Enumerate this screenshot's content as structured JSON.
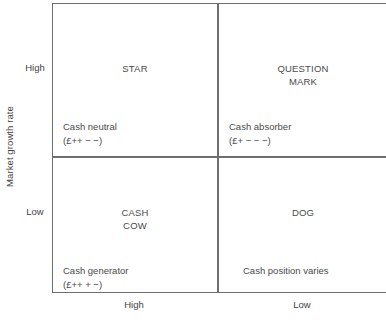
{
  "chart_data": {
    "type": "table",
    "title": "",
    "xlabel": "Relative market share",
    "ylabel": "Market growth rate",
    "x_ticks": [
      "High",
      "Low"
    ],
    "y_ticks": [
      "High",
      "Low"
    ],
    "grid": true,
    "legend": "none",
    "quadrants": [
      {
        "id": "star",
        "title": "STAR",
        "title_lines": [
          "STAR"
        ],
        "note": "Cash neutral",
        "symbols": "(£++ − −)",
        "row": "High",
        "column": "High"
      },
      {
        "id": "question-mark",
        "title": "QUESTION MARK",
        "title_lines": [
          "QUESTION",
          "MARK"
        ],
        "note": "Cash absorber",
        "symbols": "(£+ − − −)",
        "row": "High",
        "column": "Low"
      },
      {
        "id": "cash-cow",
        "title": "CASH COW",
        "title_lines": [
          "CASH",
          "COW"
        ],
        "note": "Cash generator",
        "symbols": "(£++ + −)",
        "row": "Low",
        "column": "High"
      },
      {
        "id": "dog",
        "title": "DOG",
        "title_lines": [
          "DOG"
        ],
        "note": "Cash position varies",
        "symbols": "",
        "row": "Low",
        "column": "Low"
      }
    ]
  },
  "axes": {
    "y_title": "Market growth rate",
    "y_high": "High",
    "y_low": "Low",
    "x_high": "High",
    "x_low": "Low",
    "x_title": ""
  },
  "quadrants": {
    "star": {
      "line1": "STAR",
      "line2": "",
      "note": "Cash neutral",
      "symbols": "(£++ − −)"
    },
    "question_mark": {
      "line1": "QUESTION",
      "line2": "MARK",
      "note": "Cash absorber",
      "symbols": "(£+ − − −)"
    },
    "cash_cow": {
      "line1": "CASH",
      "line2": "COW",
      "note": "Cash generator",
      "symbols": "(£++ + −)"
    },
    "dog": {
      "line1": "DOG",
      "line2": "",
      "note": "Cash position varies",
      "symbols": ""
    }
  },
  "colors": {
    "border": "#6f6f6f",
    "text": "#4a4a4a",
    "background": "#ffffff"
  }
}
